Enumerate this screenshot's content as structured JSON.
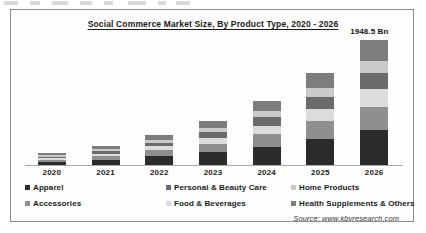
{
  "frame": {
    "border_color": "#8d8d8d"
  },
  "title": "Social Commerce Market Size, By Product Type, 2020 - 2026",
  "source": "Source: www.kbvresearch.com",
  "legend": {
    "row1": [
      {
        "label": "Apparel",
        "color": "#2b2b2b"
      },
      {
        "label": "Personal & Beauty Care",
        "color": "#6b6b6b"
      },
      {
        "label": "Home Products",
        "color": "#c9c9c9"
      }
    ],
    "row2": [
      {
        "label": "Accessories",
        "color": "#8f8f8f"
      },
      {
        "label": "Food & Beverages",
        "color": "#dcdcdc"
      },
      {
        "label": "Health Supplements & Others",
        "color": "#7d7d7d"
      }
    ]
  },
  "chart_data": {
    "type": "bar",
    "subtype": "stacked-column",
    "title": "Social Commerce Market Size, By Product Type, 2020 - 2026",
    "xlabel": "",
    "ylabel": "",
    "grid": false,
    "axis_visible": {
      "x": true,
      "y": false
    },
    "legend_position": "bottom",
    "units": "Bn",
    "categories": [
      "2020",
      "2021",
      "2022",
      "2023",
      "2024",
      "2025",
      "2026"
    ],
    "series": [
      {
        "name": "Apparel",
        "color": "#2b2b2b",
        "values": [
          60,
          95,
          150,
          210,
          300,
          420,
          560
        ]
      },
      {
        "name": "Accessories",
        "color": "#8f8f8f",
        "values": [
          38,
          58,
          92,
          130,
          190,
          270,
          360
        ]
      },
      {
        "name": "Food & Beverages",
        "color": "#dcdcdc",
        "values": [
          25,
          40,
          62,
          92,
          135,
          195,
          265
        ]
      },
      {
        "name": "Personal & Beauty Care",
        "color": "#6b6b6b",
        "values": [
          24,
          38,
          60,
          88,
          128,
          185,
          252
        ]
      },
      {
        "name": "Home Products",
        "color": "#c9c9c9",
        "values": [
          18,
          28,
          45,
          66,
          96,
          138,
          188
        ]
      },
      {
        "name": "Health Supplements & Others",
        "color": "#7d7d7d",
        "values": [
          30,
          47,
          76,
          110,
          160,
          232,
          323
        ]
      }
    ],
    "totals": [
      195,
      306,
      485,
      696,
      1009,
      1440,
      1948.5
    ],
    "data_labels": [
      {
        "category": "2026",
        "text": "1948.5 Bn",
        "value": 1948.5
      }
    ],
    "ylim": [
      0,
      1948.5
    ]
  }
}
